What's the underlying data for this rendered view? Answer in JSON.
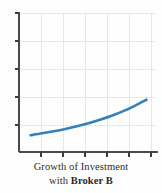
{
  "figure": {
    "background_color": "#fefefe",
    "caption_line1": "Growth of Investment",
    "caption_line2_prefix": "with ",
    "caption_line2_bold": "Broker B",
    "caption_color": "#2b2b2b"
  },
  "chart_data": {
    "type": "line",
    "title": "Growth of Investment with Broker B",
    "xlabel": "",
    "ylabel": "",
    "grid": true,
    "legend": "none",
    "series": [
      {
        "name": "Growth of Investment with Broker B",
        "color": "#3580b8",
        "line_width": 2.6,
        "x": [
          0.5,
          1.0,
          1.5,
          2.0,
          2.5,
          3.0,
          3.5,
          4.0,
          4.5,
          5.0,
          5.5
        ],
        "y": [
          0.72,
          0.8,
          0.89,
          0.99,
          1.1,
          1.23,
          1.38,
          1.55,
          1.75,
          1.98,
          2.24
        ]
      }
    ],
    "xlim": [
      0,
      6
    ],
    "ylim": [
      0,
      6
    ],
    "x_tick_count": 6,
    "y_tick_count": 6,
    "x_tick_labels": [],
    "y_tick_labels": [],
    "gridline_color": "#e2e2e2",
    "axis_color": "#4a4a4a"
  }
}
